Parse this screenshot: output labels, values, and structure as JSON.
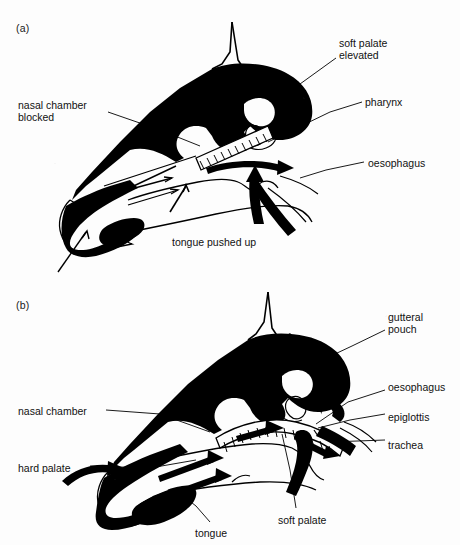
{
  "figure": {
    "background_color": "#fdfdfd",
    "ink_color": "#000000"
  },
  "panels": [
    {
      "id": "a",
      "letter": "(a)",
      "caption": "swallowing - soft palate elevated, nasal chamber blocked, tongue pushed up",
      "labels": [
        {
          "name": "soft-palate-elevated",
          "text": "soft palate\nelevated",
          "align": "left",
          "x": 339,
          "y": 38
        },
        {
          "name": "pharynx",
          "text": "pharynx",
          "align": "left",
          "x": 365,
          "y": 97
        },
        {
          "name": "oesophagus",
          "text": "oesophagus",
          "align": "left",
          "x": 368,
          "y": 158
        },
        {
          "name": "nasal-chamber-blocked",
          "text": "nasal chamber\nblocked",
          "align": "left",
          "x": 18,
          "y": 100
        },
        {
          "name": "tongue-pushed-up",
          "text": "tongue pushed up",
          "align": "left",
          "x": 172,
          "y": 237
        }
      ]
    },
    {
      "id": "b",
      "letter": "(b)",
      "caption": "breathing - air passes through nasal chamber to trachea",
      "labels": [
        {
          "name": "gutteral-pouch",
          "text": "gutteral\npouch",
          "align": "left",
          "x": 388,
          "y": 312
        },
        {
          "name": "oesophagus-b",
          "text": "oesophagus",
          "align": "left",
          "x": 388,
          "y": 382
        },
        {
          "name": "epiglottis",
          "text": "epiglottis",
          "align": "left",
          "x": 388,
          "y": 412
        },
        {
          "name": "trachea",
          "text": "trachea",
          "align": "left",
          "x": 388,
          "y": 440
        },
        {
          "name": "nasal-chamber",
          "text": "nasal chamber",
          "align": "left",
          "x": 18,
          "y": 406
        },
        {
          "name": "hard-palate",
          "text": "hard palate",
          "align": "left",
          "x": 18,
          "y": 463
        },
        {
          "name": "tongue",
          "text": "tongue",
          "align": "left",
          "x": 195,
          "y": 528
        },
        {
          "name": "soft-palate",
          "text": "soft palate",
          "align": "left",
          "x": 278,
          "y": 515
        }
      ]
    }
  ],
  "anatomy_terms": [
    "soft palate elevated",
    "pharynx",
    "oesophagus",
    "nasal chamber blocked",
    "tongue pushed up",
    "gutteral pouch",
    "epiglottis",
    "trachea",
    "nasal chamber",
    "hard palate",
    "tongue",
    "soft palate"
  ]
}
